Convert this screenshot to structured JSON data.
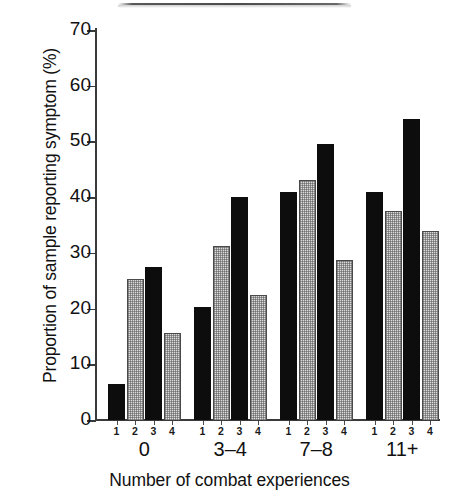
{
  "figure": {
    "ylabel": "Proportion of sample reporting symptom (%)",
    "xlabel": "Number of combat experiences"
  },
  "chart_data": {
    "type": "bar",
    "title": "",
    "xlabel": "Number of combat experiences",
    "ylabel": "Proportion of sample reporting symptom (%)",
    "ylim": [
      0,
      70
    ],
    "yticks": [
      0,
      10,
      20,
      30,
      40,
      50,
      60,
      70
    ],
    "ytick_labels": [
      "0",
      "10",
      "20",
      "30",
      "40",
      "50",
      "60",
      "70"
    ],
    "grid": false,
    "legend": "none",
    "categories": [
      "0",
      "3–4",
      "7–8",
      "11+"
    ],
    "subgroup_labels": [
      "1",
      "2",
      "3",
      "4"
    ],
    "series": [
      {
        "name": "1",
        "fill": "solid-black",
        "values": [
          6.5,
          20.2,
          41.0,
          41.0
        ]
      },
      {
        "name": "2",
        "fill": "light-stipple",
        "values": [
          25.4,
          31.3,
          43.0,
          37.5
        ]
      },
      {
        "name": "3",
        "fill": "solid-black",
        "values": [
          27.5,
          40.0,
          49.5,
          54.0
        ]
      },
      {
        "name": "4",
        "fill": "light-stipple",
        "values": [
          15.7,
          22.5,
          28.7,
          34.0
        ]
      }
    ],
    "colors": {
      "solid-black": "#0d0d0d",
      "light-stipple": "#dcdcdc",
      "axis": "#3a3a3a",
      "background": "#ffffff"
    }
  }
}
